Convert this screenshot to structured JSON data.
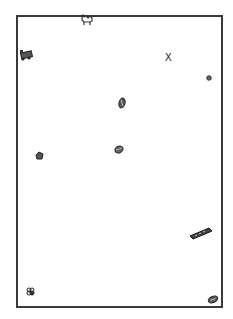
{
  "scene": {
    "frame": {
      "border_color": "#3a3a3a",
      "background": "#ffffff"
    },
    "marker": {
      "label": "X"
    },
    "objects": [
      {
        "name": "camel",
        "x": 81,
        "y": 16
      },
      {
        "name": "toy-train",
        "x": 18,
        "y": 49
      },
      {
        "name": "x-marker",
        "x": 166,
        "y": 54
      },
      {
        "name": "small-ball",
        "x": 207,
        "y": 75
      },
      {
        "name": "seed-pod",
        "x": 118,
        "y": 98
      },
      {
        "name": "shell",
        "x": 114,
        "y": 145
      },
      {
        "name": "gem",
        "x": 35,
        "y": 151
      },
      {
        "name": "harmonica",
        "x": 190,
        "y": 227
      },
      {
        "name": "flower",
        "x": 26,
        "y": 287
      },
      {
        "name": "pine-cone",
        "x": 207,
        "y": 296
      }
    ]
  }
}
